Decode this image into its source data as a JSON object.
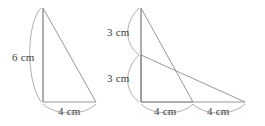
{
  "figure": {
    "stroke_color": "#8c8c8c",
    "brace_color": "#9a9a9a",
    "text_color": "#3d3d3d",
    "background": "#ffffff",
    "left_triangle": {
      "name": "single-triangle",
      "height_label": "6 cm",
      "base_label": "4 cm",
      "apex": [
        43,
        8
      ],
      "bottom_left": [
        43,
        102
      ],
      "bottom_right": [
        96,
        102
      ]
    },
    "right_triangles": {
      "name": "two-overlapping-triangles",
      "upper_height_label": "3 cm",
      "lower_height_label": "3 cm",
      "base_label_1": "4 cm",
      "base_label_2": "4 cm",
      "apex": [
        141,
        8
      ],
      "midpoint": [
        141,
        55
      ],
      "bottom_left": [
        141,
        102
      ],
      "bottom_mid": [
        193,
        102
      ],
      "bottom_right": [
        245,
        102
      ]
    }
  }
}
